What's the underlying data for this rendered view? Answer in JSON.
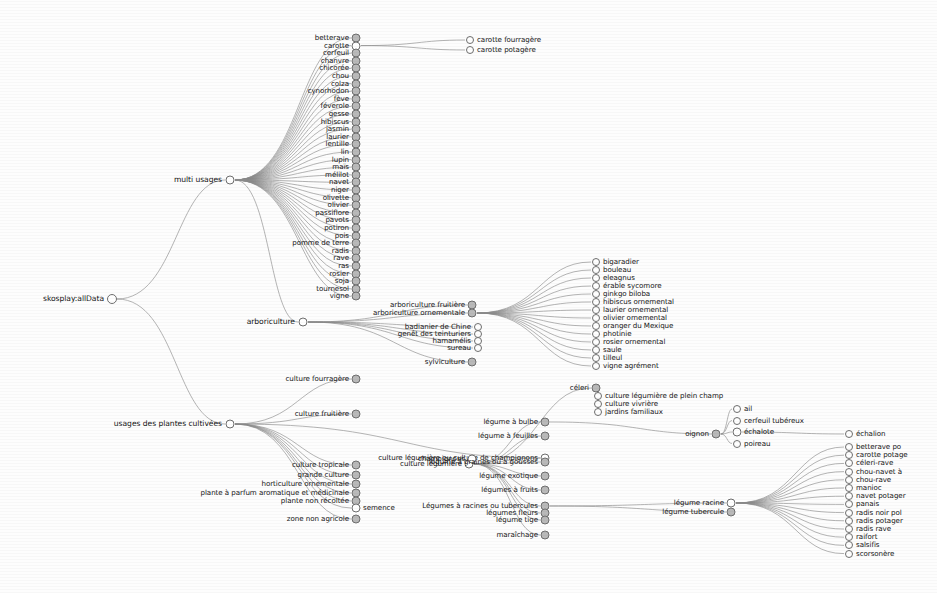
{
  "diagram": {
    "type": "radial-tree",
    "title_node": "skosplay:allData",
    "root": {
      "label": "skosplay:allData",
      "x": 112,
      "y": 299
    },
    "level1": [
      {
        "label": "multi usages",
        "x": 230,
        "y": 180
      },
      {
        "label": "usages des plantes cultivées",
        "x": 230,
        "y": 424
      }
    ],
    "multi_usages_children": [
      "betterave",
      "carotte",
      "cerfeuil",
      "chanvre",
      "chicorée",
      "chou",
      "colza",
      "cynorhodon",
      "fève",
      "féverole",
      "gesse",
      "hibiscus",
      "jasmin",
      "laurier",
      "lentille",
      "lin",
      "lupin",
      "maïs",
      "mélilot",
      "navet",
      "niger",
      "olivette",
      "olivier",
      "passiflore",
      "pavots",
      "potiron",
      "pois",
      "pomme de terre",
      "radis",
      "rave",
      "ras",
      "rosier",
      "soja",
      "tournesol",
      "vigne"
    ],
    "carotte_children": [
      "carotte fourragère",
      "carotte potagère"
    ],
    "arboriculture": {
      "label": "arboriculture",
      "children": [
        "arboriculture fruitière",
        "arboriculture ornementale",
        "badianier de Chine",
        "genêt des teinturiers",
        "hamamélis",
        "sureau",
        "sylviculture"
      ]
    },
    "arbo_ornementale_children": [
      "bigaradier",
      "bouleau",
      "eleagnus",
      "érable sycomore",
      "ginkgo biloba",
      "hibiscus ornemental",
      "laurier ornemental",
      "olivier ornemental",
      "oranger du Mexique",
      "photinie",
      "rosier ornemental",
      "saule",
      "tilleul",
      "vigne agrément"
    ],
    "usages_children": [
      "culture fourragère",
      "culture fruitière",
      "culture légumière ou culture de champignons",
      "culture tropicale",
      "grande culture",
      "horticulture ornementale",
      "plante à parfum aromatique et médicinale",
      "plante non récoltée",
      "semence",
      "zone non agricole"
    ],
    "culture_legumiere": {
      "label": "culture légumière",
      "children": [
        "céleri",
        "légume à bulbe",
        "légume à feuilles",
        "champignons",
        "légume à graines ou à gousses",
        "légume exotique",
        "légumes à fruits",
        "Légumes à racines ou tubercules",
        "légumes fleurs",
        "légume tige",
        "maraîchage"
      ]
    },
    "celeri_group": [
      "culture légumière de plein champ",
      "culture vivrière",
      "jardins familiaux"
    ],
    "bulbe_group": {
      "label": "oignon",
      "children": [
        "ail",
        "cerfeuil tubéreux",
        "échalote",
        "poireau"
      ]
    },
    "echalion": "échalion",
    "racine_group": {
      "label": "légume racine",
      "sub": "légume tubercule"
    },
    "racine_children": [
      "betterave po",
      "carotte potage",
      "céleri-rave",
      "chou-navet à",
      "chou-rave",
      "manioc",
      "navet potager",
      "panais",
      "radis noir pol",
      "radis potager",
      "radis rave",
      "raifort",
      "salsifis",
      "scorsonère"
    ]
  },
  "colors": {
    "edge": "#8a8a8a",
    "node_stroke": "#6e6e6e",
    "node_fill_open": "#ffffff",
    "node_fill_closed": "#b9b9b9",
    "text": "#141414",
    "background": "#fdfdfd"
  }
}
